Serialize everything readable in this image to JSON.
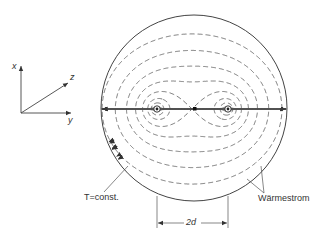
{
  "figure": {
    "labels": {
      "isotherm": "T=const.",
      "heat_flow": "Wärmestrom",
      "dimension": "2d"
    },
    "axes": {
      "x": "x",
      "y": "y",
      "z": "z"
    },
    "colors": {
      "line": "#444444",
      "background": "#ffffff"
    },
    "geometry": {
      "circle_center": [
        194,
        108
      ],
      "circle_radius": 93,
      "sources_center": [
        192,
        109
      ],
      "source_half_distance": 35
    }
  }
}
